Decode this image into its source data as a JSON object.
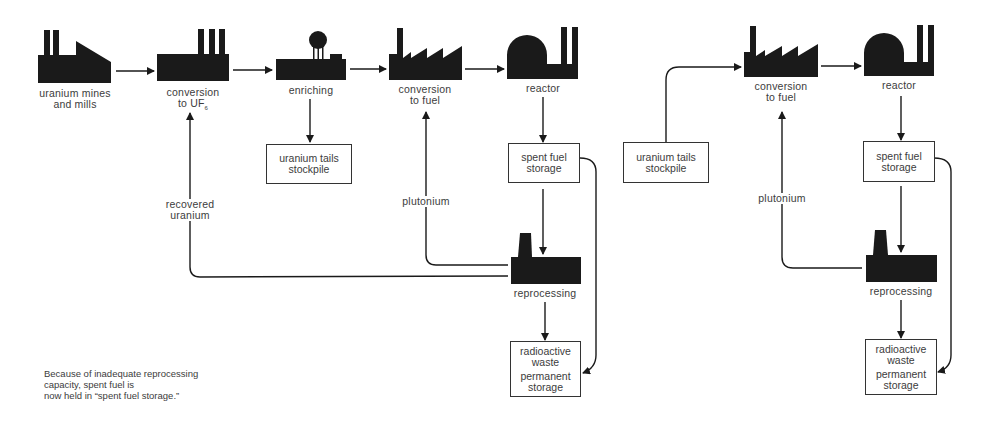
{
  "left_cycle": {
    "nodes": {
      "mines": {
        "line1": "uranium mines",
        "line2": "and mills",
        "icon": "factory-icon"
      },
      "conversion_uf6": {
        "line1": "conversion",
        "line2": "to UF",
        "sub": "6",
        "icon": "factory-icon"
      },
      "enriching": {
        "label": "enriching",
        "icon": "enrichment-plant-icon"
      },
      "conversion_fuel": {
        "line1": "conversion",
        "line2": "to fuel",
        "icon": "factory-icon"
      },
      "reactor": {
        "label": "reactor",
        "icon": "reactor-icon"
      },
      "reprocessing": {
        "label": "reprocessing",
        "icon": "reprocessing-plant-icon"
      }
    },
    "boxes": {
      "tails": {
        "line1": "uranium tails",
        "line2": "stockpile"
      },
      "spent_fuel": {
        "line1": "spent fuel",
        "line2": "storage"
      },
      "waste": {
        "line1": "radioactive",
        "line2": "waste",
        "line3": "permanent",
        "line4": "storage"
      }
    },
    "flow_labels": {
      "recovered_uranium": {
        "line1": "recovered",
        "line2": "uranium"
      },
      "plutonium": "plutonium"
    }
  },
  "right_cycle": {
    "nodes": {
      "conversion_fuel": {
        "line1": "conversion",
        "line2": "to fuel",
        "icon": "factory-icon"
      },
      "reactor": {
        "label": "reactor",
        "icon": "reactor-icon"
      },
      "reprocessing": {
        "label": "reprocessing",
        "icon": "reprocessing-plant-icon"
      }
    },
    "boxes": {
      "tails": {
        "line1": "uranium tails",
        "line2": "stockpile"
      },
      "spent_fuel": {
        "line1": "spent fuel",
        "line2": "storage"
      },
      "waste": {
        "line1": "radioactive",
        "line2": "waste",
        "line3": "permanent",
        "line4": "storage"
      }
    },
    "flow_labels": {
      "plutonium": "plutonium"
    }
  },
  "note": {
    "line1": "Because of inadequate reprocessing",
    "line2": "capacity, spent fuel is",
    "line3": "now held in “spent fuel storage.”"
  },
  "colors": {
    "ink": "#1a1a1a",
    "text": "#3c3c3c",
    "background": "#ffffff"
  }
}
